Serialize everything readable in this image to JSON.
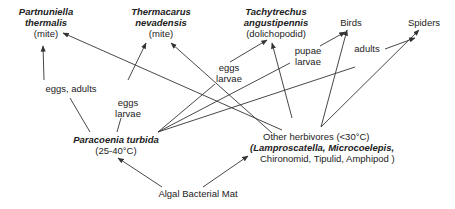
{
  "nodes": {
    "partnuniella": {
      "line1": "Partnuniella",
      "line2": "thermalis",
      "line3": "(mite)"
    },
    "thermacarus": {
      "line1": "Thermacarus",
      "line2": "nevadensis",
      "line3": "(mite)"
    },
    "tachytrechus": {
      "line1": "Tachytrechus",
      "line2": "angustipennis",
      "line3": "(dolichopodid)"
    },
    "birds": {
      "label": "Birds"
    },
    "spiders": {
      "label": "Spiders"
    },
    "paracoenia": {
      "line1": "Paracoenia turbida",
      "line2": "(25-40°C)"
    },
    "herbivores": {
      "line1": "Other herbivores  (<30°C)",
      "line2_italic": "(Lamproscatella, Microcoelepis,",
      "line3": "Chironomid, Tipulid, Amphipod )"
    },
    "mat": {
      "label": "Algal Bacterial Mat"
    }
  },
  "edge_labels": {
    "eggs_adults": "eggs, adults",
    "eggs_larvae_thermacarus": {
      "line1": "eggs",
      "line2": "larvae"
    },
    "eggs_larvae_tachy": {
      "line1": "eggs",
      "line2": "larvae"
    },
    "pupae_larvae": {
      "line1": "pupae",
      "line2": "larvae"
    },
    "adults": "adults"
  },
  "colors": {
    "line": "#333333",
    "text": "#222222"
  }
}
